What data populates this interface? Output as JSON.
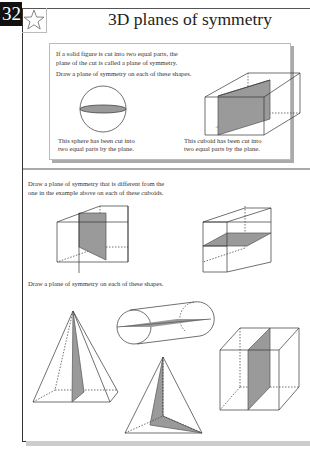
{
  "page": {
    "number": "32",
    "title": "3D planes of symmetry",
    "star_icon": "star-outline-icon"
  },
  "example": {
    "intro_line1": "If a solid figure is cut into two equal parts, the",
    "intro_line2": "plane of the cut is called a plane of symmetry.",
    "instruction": "Draw a plane of symmetry on each of these shapes.",
    "sphere_caption_line1": "This sphere has been cut into",
    "sphere_caption_line2": "two equal parts by the plane.",
    "cuboid_caption_line1": "This cuboid has been cut into",
    "cuboid_caption_line2": "two equal parts by the plane."
  },
  "exercise1": {
    "instruction_line1": "Draw a plane of symmetry that is different from the",
    "instruction_line2": "one in the example above on each of these cuboids.",
    "shapes": [
      "cuboid-vertical-plane",
      "cuboid-horizontal-plane"
    ]
  },
  "exercise2": {
    "instruction": "Draw a plane of symmetry on each of these shapes.",
    "shapes": [
      "square-pyramid",
      "cylinder",
      "triangular-pyramid",
      "cube"
    ]
  },
  "colors": {
    "plane_fill": "#9a9a9a",
    "line": "#333333",
    "page_number_bg": "#111111"
  }
}
